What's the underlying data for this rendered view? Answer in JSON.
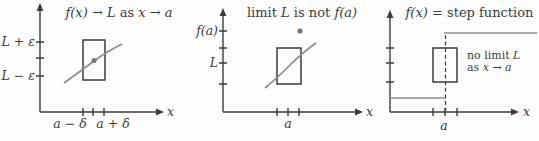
{
  "colors": {
    "ink": "#3b3b3b",
    "curve_gray": "#8c8c8c",
    "background": "#fdfdfd"
  },
  "panels": {
    "p1": {
      "title": [
        {
          "text": "f(x) → L",
          "italic": true
        },
        {
          "text": " as ",
          "italic": false
        },
        {
          "text": "x → a",
          "italic": true
        }
      ],
      "y_tick_labels": [
        "L + ε",
        "L − ε"
      ],
      "x_tick_labels": [
        "a − δ",
        "a + δ"
      ],
      "axis_label_x": "x"
    },
    "p2": {
      "title": [
        {
          "text": "limit ",
          "italic": false
        },
        {
          "text": "L",
          "italic": true
        },
        {
          "text": " is not ",
          "italic": false
        },
        {
          "text": "f(a)",
          "italic": true
        }
      ],
      "y_tick_labels": [
        "f(a)",
        "L"
      ],
      "x_tick_labels": [
        "a"
      ],
      "axis_label_x": "x"
    },
    "p3": {
      "title": [
        {
          "text": "f(x)",
          "italic": true
        },
        {
          "text": " = step function",
          "italic": false
        }
      ],
      "note_line1": [
        {
          "text": "no limit ",
          "italic": false
        },
        {
          "text": "L",
          "italic": true
        }
      ],
      "note_line2": [
        {
          "text": "as ",
          "italic": false
        },
        {
          "text": "x → a",
          "italic": true
        }
      ],
      "x_tick_labels": [
        "a"
      ],
      "axis_label_x": "x"
    }
  }
}
